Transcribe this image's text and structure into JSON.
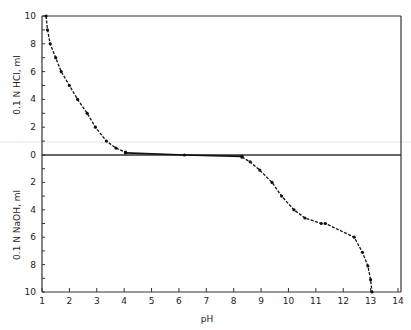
{
  "chart_data": {
    "type": "line",
    "title": "",
    "xlabel": "pH",
    "ylabel_upper": "0.1 N HCl, ml",
    "ylabel_lower": "0.1 N NaOH, ml",
    "xlim": [
      1,
      14
    ],
    "ylim_upper": [
      0,
      10
    ],
    "ylim_lower": [
      0,
      10
    ],
    "grid": false,
    "x_ticks": [
      1,
      2,
      3,
      4,
      5,
      6,
      7,
      8,
      9,
      10,
      11,
      12,
      13,
      14
    ],
    "y_ticks_upper": [
      0,
      2,
      4,
      6,
      8,
      10
    ],
    "y_ticks_lower": [
      2,
      4,
      6,
      8,
      10
    ],
    "series": [
      {
        "name": "HCl titration (acid side)",
        "points": [
          {
            "ph": 1.15,
            "ml": 10.0
          },
          {
            "ph": 1.2,
            "ml": 9.0
          },
          {
            "ph": 1.3,
            "ml": 8.0
          },
          {
            "ph": 1.5,
            "ml": 7.0
          },
          {
            "ph": 1.7,
            "ml": 6.0
          },
          {
            "ph": 2.0,
            "ml": 5.0
          },
          {
            "ph": 2.3,
            "ml": 4.0
          },
          {
            "ph": 2.65,
            "ml": 3.0
          },
          {
            "ph": 2.95,
            "ml": 2.0
          },
          {
            "ph": 3.35,
            "ml": 1.0
          },
          {
            "ph": 3.7,
            "ml": 0.5
          },
          {
            "ph": 4.05,
            "ml": 0.2
          }
        ]
      },
      {
        "name": "Near-neutral plateau",
        "points": [
          {
            "ph": 4.05,
            "ml": 0.15
          },
          {
            "ph": 6.2,
            "ml": 0.0
          },
          {
            "ph": 8.3,
            "ml": -0.1
          }
        ]
      },
      {
        "name": "NaOH titration (base side)",
        "points": [
          {
            "ph": 8.3,
            "ml": 0.15
          },
          {
            "ph": 8.6,
            "ml": 0.5
          },
          {
            "ph": 8.95,
            "ml": 1.1
          },
          {
            "ph": 9.4,
            "ml": 2.0
          },
          {
            "ph": 9.75,
            "ml": 3.0
          },
          {
            "ph": 10.2,
            "ml": 4.0
          },
          {
            "ph": 10.6,
            "ml": 4.6
          },
          {
            "ph": 11.2,
            "ml": 5.0
          },
          {
            "ph": 11.35,
            "ml": 5.0
          },
          {
            "ph": 12.4,
            "ml": 6.0
          },
          {
            "ph": 12.7,
            "ml": 7.1
          },
          {
            "ph": 12.9,
            "ml": 8.1
          },
          {
            "ph": 13.0,
            "ml": 9.1
          },
          {
            "ph": 13.05,
            "ml": 10.0
          }
        ]
      }
    ]
  },
  "labels": {
    "x_axis": "pH",
    "y_upper": "0.1 N HCl, ml",
    "y_lower": "0.1 N NaOH, ml"
  }
}
